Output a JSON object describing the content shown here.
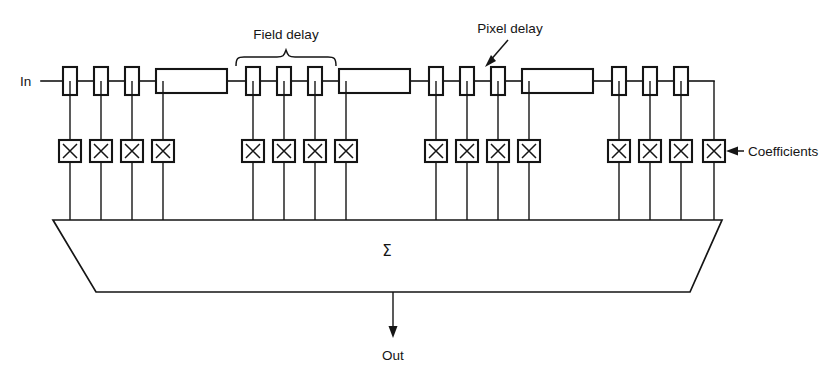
{
  "diagram": {
    "type": "block-diagram",
    "background_color": "#ffffff",
    "line_color": "#151515",
    "labels": {
      "input": "In",
      "output": "Out",
      "field_delay": "Field delay",
      "pixel_delay": "Pixel delay",
      "coefficients": "Coefficients",
      "summation": "Σ"
    },
    "structure": {
      "tap_group_count": 4,
      "taps_per_group": 4,
      "total_taps": 16,
      "multiplier_symbol": "X",
      "delay_line_pattern": "pixel, pixel, pixel, field",
      "pixel_delay_boxes": 12,
      "field_delay_boxes": 4,
      "summation_block_shape": "trapezoid"
    },
    "annotations": [
      {
        "name": "field-delay",
        "text": "Field delay",
        "marker": "brace",
        "points_to": "fourth delay element of first span (large box)"
      },
      {
        "name": "pixel-delay",
        "text": "Pixel delay",
        "marker": "arrow",
        "points_to": "small delay box"
      },
      {
        "name": "coefficients",
        "text": "Coefficients",
        "marker": "arrow",
        "points_to": "last multiplier box"
      }
    ]
  }
}
